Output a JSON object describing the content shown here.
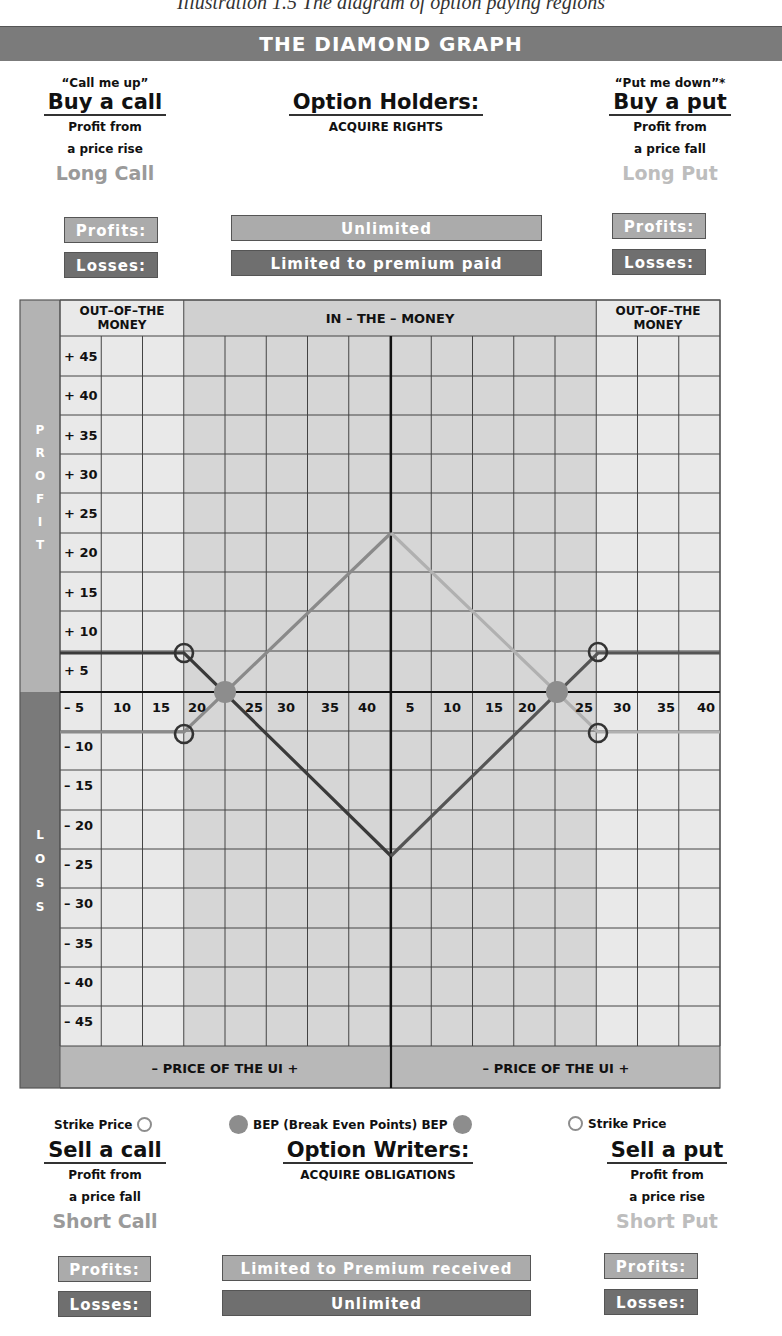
{
  "page": {
    "caption": "Illustration 1.5 The diagram of option paying regions",
    "title": "THE DIAMOND GRAPH"
  },
  "top": {
    "buy_call": {
      "quote": "“Call me up”",
      "headline": "Buy a call",
      "line1": "Profit from",
      "line2": "a price rise",
      "position": "Long Call",
      "profits_label": "Profits:",
      "losses_label": "Losses:"
    },
    "holders": {
      "headline": "Option Holders:",
      "subtitle": "ACQUIRE RIGHTS",
      "profits_value": "Unlimited",
      "losses_value": "Limited to premium paid"
    },
    "buy_put": {
      "quote": "“Put me down”*",
      "headline": "Buy a put",
      "line1": "Profit from",
      "line2": "a price fall",
      "position": "Long Put",
      "profits_label": "Profits:",
      "losses_label": "Losses:"
    }
  },
  "bottom": {
    "sell_call": {
      "legend": "Strike Price",
      "headline": "Sell a call",
      "line1": "Profit from",
      "line2": "a price fall",
      "position": "Short Call",
      "profits_label": "Profits:",
      "losses_label": "Losses:"
    },
    "writers": {
      "legend": "BEP (Break Even Points) BEP",
      "headline": "Option Writers:",
      "subtitle": "ACQUIRE OBLIGATIONS",
      "profits_value": "Limited to Premium received",
      "losses_value": "Unlimited"
    },
    "sell_put": {
      "legend": "Strike Price",
      "headline": "Sell a put",
      "line1": "Profit from",
      "line2": "a price rise",
      "position": "Short Put",
      "profits_label": "Profits:",
      "losses_label": "Losses:"
    }
  },
  "colors": {
    "title_bar": "#7b7b7b",
    "pill_light": "#ababab",
    "pill_dark": "#6f6f6f",
    "otm_zone": "#e9e9e9",
    "itm_zone": "#d6d6d6",
    "profit_bar": "#b3b3b3",
    "loss_bar": "#7a7a7a",
    "line_dark": "#3a3a3a",
    "line_mid": "#8a8a8a",
    "line_light": "#b0b0b0",
    "bep": "#8d8d8d"
  },
  "chart_data": {
    "type": "line",
    "title": "THE DIAMOND GRAPH",
    "xlabel": "–  PRICE OF THE UI  +",
    "ylabel_top": "PROFIT",
    "ylabel_bottom": "LOSS",
    "zone_labels": [
      "OUT–OF–THE MONEY",
      "IN – THE – MONEY",
      "OUT–OF–THE MONEY"
    ],
    "y_ticks": [
      "+ 45",
      "+ 40",
      "+ 35",
      "+ 30",
      "+ 25",
      "+ 20",
      "+ 15",
      "+ 10",
      "+ 5",
      "– 5",
      "– 10",
      "– 15",
      "– 20",
      "– 25",
      "– 30",
      "– 35",
      "– 40",
      "– 45"
    ],
    "x_ticks_left": [
      "10",
      "15",
      "20",
      "25",
      "30",
      "35",
      "40"
    ],
    "x_ticks_right": [
      "5",
      "10",
      "15",
      "20",
      "25",
      "30",
      "35",
      "40"
    ],
    "ylim": [
      -45,
      45
    ],
    "grid": true,
    "series": [
      {
        "name": "Long Call",
        "shade": "mid",
        "points": [
          [
            5,
            -7.5
          ],
          [
            20,
            -7.5
          ],
          [
            40,
            22.5
          ]
        ]
      },
      {
        "name": "Short Call",
        "shade": "dark",
        "points": [
          [
            5,
            7.5
          ],
          [
            20,
            7.5
          ],
          [
            40,
            -22.5
          ]
        ]
      },
      {
        "name": "Long Put",
        "shade": "light",
        "points": [
          [
            40,
            22.5
          ],
          [
            25,
            0
          ],
          [
            30,
            -7.5
          ],
          [
            40,
            -7.5
          ]
        ],
        "side": "right"
      },
      {
        "name": "Short Put",
        "shade": "dark",
        "points": [
          [
            40,
            -22.5
          ],
          [
            25,
            0
          ],
          [
            30,
            7.5
          ],
          [
            40,
            7.5
          ]
        ],
        "side": "right"
      }
    ],
    "markers": {
      "strike_price": [
        "left x=20, y=±7.5",
        "right x=27.5, y=±7.5"
      ],
      "bep": [
        "left x=22.5, y=0",
        "right x=22.5, y=0"
      ]
    }
  }
}
